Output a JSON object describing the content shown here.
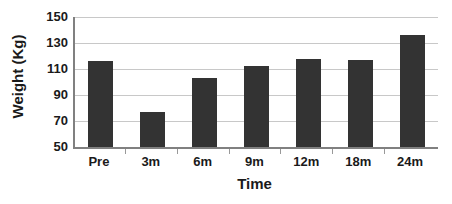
{
  "chart_data": {
    "type": "bar",
    "title": "",
    "xlabel": "Time",
    "ylabel": "Weight (Kg)",
    "categories": [
      "Pre",
      "3m",
      "6m",
      "9m",
      "12m",
      "18m",
      "24m"
    ],
    "values": [
      116,
      77,
      103,
      112,
      118,
      117,
      136
    ],
    "ylim": [
      50,
      150
    ],
    "yticks": [
      50,
      70,
      90,
      110,
      130,
      150
    ],
    "ytick_labels": [
      "50",
      "70",
      "90",
      "110",
      "130",
      "150"
    ],
    "grid": true,
    "legend": false,
    "bar_color": "#333333",
    "gridline_color": "#c8c8c8",
    "axis_color": "#808080",
    "background_color": "#ffffff"
  }
}
